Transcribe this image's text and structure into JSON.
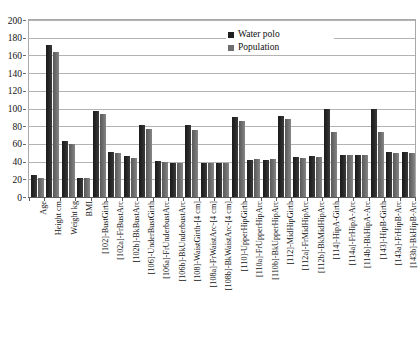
{
  "chart_data": {
    "type": "bar",
    "title": "",
    "subtitle": "",
    "xlabel": "",
    "ylabel": "",
    "ylim": [
      0,
      200
    ],
    "ytick_step": 20,
    "yticks": [
      0,
      20,
      40,
      60,
      80,
      100,
      120,
      140,
      160,
      180,
      200
    ],
    "grid": true,
    "legend_position": "top-right",
    "categories": [
      "Age",
      "Height cm",
      "Weight kg",
      "BMI",
      "[102]-BustGirth",
      "[102a]-FrBustArc",
      "[102b]-BkBustArc",
      "[106]-UnderBustGirth",
      "[106a]-FrUnderbustArc",
      "[106b]-BkUnderbustArc",
      "[108]-WaistGirth-[4 cm]",
      "[108a]-FrWaistArc-[4 cm]",
      "[108b]-BkWaistArc-[4 cm]",
      "[110]-UpperHipGirth",
      "[110a]-FrUpperHipArc",
      "[110b]-BkUpperHipArc",
      "[112]-MidHipGirth",
      "[112a]-FrMidHipArc",
      "[112b]-BkMidHipArc",
      "[114]-HipA-Girth",
      "[114a]-FrHipA-Arc",
      "[114b]-BkHipA-Arc",
      "[143]-HipB-Girth",
      "[143a]-FrHipB-Arc",
      "[143b]-BkHipB-Arc"
    ],
    "series": [
      {
        "name": "Water polo",
        "color": "#1f1f1f",
        "values": [
          25,
          172,
          63,
          21,
          97,
          51,
          46,
          81,
          41,
          39,
          81,
          39,
          39,
          90,
          42,
          42,
          92,
          45,
          46,
          100,
          48,
          48,
          100,
          51,
          51
        ]
      },
      {
        "name": "Population",
        "color": "#6e6e6e",
        "values": [
          22,
          164,
          60,
          21,
          94,
          50,
          44,
          77,
          40,
          39,
          76,
          39,
          39,
          86,
          43,
          43,
          88,
          44,
          45,
          74,
          47,
          48,
          74,
          50,
          50
        ]
      }
    ]
  },
  "legend": {
    "items": [
      {
        "label": "Water polo",
        "series": 0
      },
      {
        "label": "Population",
        "series": 1
      }
    ]
  }
}
